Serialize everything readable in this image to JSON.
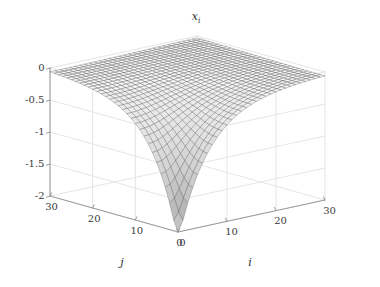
{
  "figure": {
    "background_color": "#ffffff",
    "title": "x",
    "title_subscript": "i",
    "title_full": "x_i"
  },
  "axes": {
    "z": {
      "label": "",
      "ticks": [
        "0",
        "-0.5",
        "-1",
        "-1.5",
        "-2"
      ],
      "values": [
        0,
        -0.5,
        -1,
        -1.5,
        -2
      ],
      "range": [
        -2,
        0
      ]
    },
    "j": {
      "label": "j",
      "ticks": [
        "30",
        "20",
        "10",
        "0"
      ],
      "values": [
        30,
        20,
        10,
        0
      ],
      "range": [
        0,
        30
      ]
    },
    "i": {
      "label": "i",
      "ticks": [
        "0",
        "10",
        "20",
        "30"
      ],
      "values": [
        0,
        10,
        20,
        30
      ],
      "range": [
        0,
        30
      ]
    }
  },
  "style": {
    "mesh_line_color": "#2b2b2b",
    "grid_line_color": "#e2e2e2",
    "axis_line_color": "#9a9a9a",
    "surface_light": "#f2f2f2",
    "surface_mid": "#b8b8b8",
    "surface_dark": "#6e6e6e"
  },
  "chart_data": {
    "type": "surface",
    "xlabel": "i",
    "ylabel": "j",
    "zlabel": "x_i",
    "xlim": [
      0,
      30
    ],
    "ylim": [
      0,
      30
    ],
    "zlim": [
      -2,
      0
    ],
    "grid": true,
    "legend": null,
    "colormap": "gray",
    "mesh_n_i": 30,
    "mesh_n_j": 30,
    "z_min": -2.0,
    "z_max": 0.0,
    "z_min_location": {
      "i": 0,
      "j": 0
    },
    "surface_samples": [
      {
        "i": 0,
        "j": 0,
        "z": -2.0
      },
      {
        "i": 0,
        "j": 5,
        "z": -1.3
      },
      {
        "i": 0,
        "j": 10,
        "z": -0.8
      },
      {
        "i": 0,
        "j": 15,
        "z": -0.5
      },
      {
        "i": 0,
        "j": 20,
        "z": -0.3
      },
      {
        "i": 0,
        "j": 30,
        "z": -0.12
      },
      {
        "i": 5,
        "j": 0,
        "z": -1.3
      },
      {
        "i": 5,
        "j": 5,
        "z": -1.05
      },
      {
        "i": 5,
        "j": 10,
        "z": -0.7
      },
      {
        "i": 5,
        "j": 20,
        "z": -0.28
      },
      {
        "i": 10,
        "j": 0,
        "z": -0.8
      },
      {
        "i": 10,
        "j": 10,
        "z": -0.45
      },
      {
        "i": 10,
        "j": 20,
        "z": -0.18
      },
      {
        "i": 10,
        "j": 30,
        "z": -0.08
      },
      {
        "i": 15,
        "j": 15,
        "z": -0.15
      },
      {
        "i": 20,
        "j": 0,
        "z": -0.3
      },
      {
        "i": 20,
        "j": 20,
        "z": -0.06
      },
      {
        "i": 30,
        "j": 0,
        "z": -0.12
      },
      {
        "i": 30,
        "j": 15,
        "z": -0.04
      },
      {
        "i": 30,
        "j": 30,
        "z": 0.0
      }
    ]
  }
}
